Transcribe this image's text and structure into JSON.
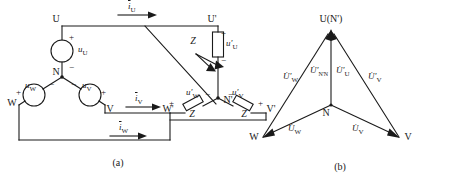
{
  "figure": {
    "caption_a": "(a)",
    "caption_b": "(b)"
  },
  "circuit": {
    "source_terminals": {
      "u": "U",
      "v": "V",
      "w": "W",
      "neutral": "N"
    },
    "load_terminals": {
      "u": "U'",
      "v": "V'",
      "w": "W'",
      "neutral": "N'"
    },
    "source_voltages": {
      "u": "u",
      "u_sub": "U",
      "v": "u",
      "v_sub": "V",
      "w": "u",
      "w_sub": "W"
    },
    "load_voltages": {
      "u": "u'",
      "u_sub": "U",
      "v": "u'",
      "v_sub": "V",
      "w": "u'",
      "w_sub": "W"
    },
    "currents": {
      "u": "i",
      "u_sub": "U",
      "v": "i",
      "v_sub": "V",
      "w": "i",
      "w_sub": "W"
    },
    "impedance_label": "Z",
    "impedances": [
      "Z",
      "Z",
      "Z"
    ],
    "polarity_plus": "+",
    "polarity_minus": "−"
  },
  "phasor": {
    "apex_label": "U(N')",
    "neutral_label": "N",
    "w_label": "W",
    "v_label": "V",
    "vectors": [
      {
        "name": "U-prime-W",
        "symbol": "U̇'",
        "sub": "W"
      },
      {
        "name": "U-prime-NN",
        "symbol": "U̇'",
        "sub": "N'N"
      },
      {
        "name": "U-prime-U",
        "symbol": "U̇'",
        "sub": "U"
      },
      {
        "name": "U-prime-V",
        "symbol": "U̇'",
        "sub": "V"
      },
      {
        "name": "U-W",
        "symbol": "U̇",
        "sub": "W"
      },
      {
        "name": "U-V",
        "symbol": "U̇",
        "sub": "V"
      }
    ]
  },
  "colors": {
    "line": "#1a1a1a",
    "background": "#ffffff"
  }
}
